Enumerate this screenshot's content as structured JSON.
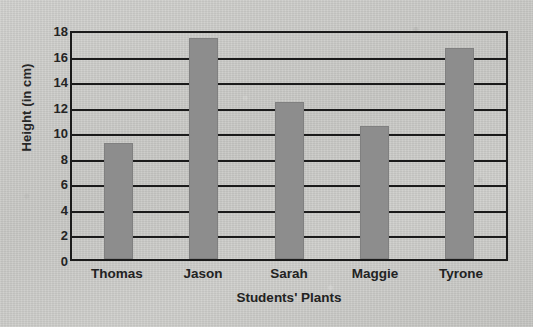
{
  "chart_data": {
    "type": "bar",
    "title": "",
    "xlabel": "Students' Plants",
    "ylabel": "Height (in cm)",
    "categories": [
      "Thomas",
      "Jason",
      "Sarah",
      "Maggie",
      "Tyrone"
    ],
    "values": [
      9.1,
      17.3,
      12.3,
      10.4,
      16.5
    ],
    "series": [
      {
        "name": "Height (in cm)",
        "values": [
          9.1,
          17.3,
          12.3,
          10.4,
          16.5
        ]
      }
    ],
    "ylim": [
      0,
      18
    ],
    "yticks": [
      0,
      2,
      4,
      6,
      8,
      10,
      12,
      14,
      16,
      18
    ],
    "ytick_labels": [
      "0",
      "2",
      "4",
      "6",
      "8",
      "10",
      "12",
      "14",
      "16",
      "18"
    ],
    "grid": true,
    "grid_axis": "y",
    "legend": false,
    "legend_position": "none",
    "bar_color": "#8d8d8d",
    "axis_color": "#1b1b1b",
    "background_color": "#cdcdcb",
    "text_color": "#222222"
  }
}
